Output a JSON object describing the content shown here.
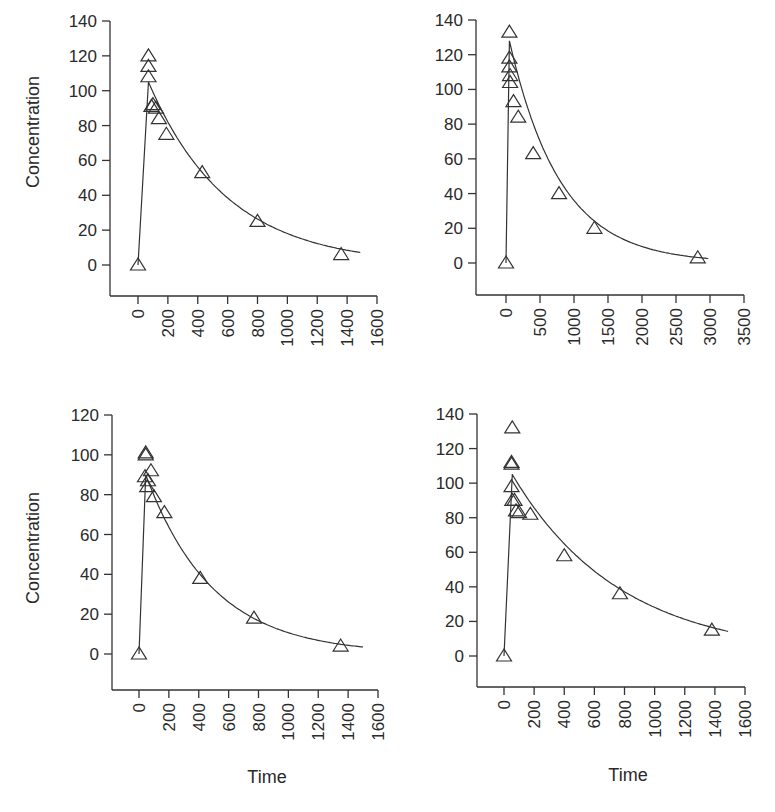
{
  "chart_data": [
    {
      "type": "scatter",
      "panel": "top-left",
      "title": "",
      "xlabel": "",
      "ylabel": "Concentration",
      "xlim": [
        0,
        1600
      ],
      "ylim": [
        0,
        140
      ],
      "xticks": [
        0,
        200,
        400,
        600,
        800,
        1000,
        1200,
        1400,
        1600
      ],
      "yticks": [
        0,
        20,
        40,
        60,
        80,
        100,
        120,
        140
      ],
      "grid": false,
      "legend": null,
      "marker": "open-triangle",
      "points": [
        {
          "x": 0,
          "y": 0
        },
        {
          "x": 70,
          "y": 120
        },
        {
          "x": 70,
          "y": 114
        },
        {
          "x": 70,
          "y": 108
        },
        {
          "x": 90,
          "y": 91
        },
        {
          "x": 100,
          "y": 92
        },
        {
          "x": 120,
          "y": 90
        },
        {
          "x": 140,
          "y": 84
        },
        {
          "x": 190,
          "y": 75
        },
        {
          "x": 430,
          "y": 53
        },
        {
          "x": 800,
          "y": 25
        },
        {
          "x": 1360,
          "y": 6
        }
      ],
      "fit_curve": {
        "peak_x": 70,
        "peak_y": 105,
        "end_x": 1500,
        "end_y": 7,
        "half_life_approx": 350
      }
    },
    {
      "type": "scatter",
      "panel": "top-right",
      "title": "",
      "xlabel": "",
      "ylabel": "",
      "xlim": [
        0,
        3500
      ],
      "ylim": [
        0,
        140
      ],
      "xticks": [
        0,
        500,
        1000,
        1500,
        2000,
        2500,
        3000,
        3500
      ],
      "yticks": [
        0,
        20,
        40,
        60,
        80,
        100,
        120,
        140
      ],
      "grid": false,
      "legend": null,
      "marker": "open-triangle",
      "points": [
        {
          "x": 0,
          "y": 0
        },
        {
          "x": 50,
          "y": 133
        },
        {
          "x": 50,
          "y": 118
        },
        {
          "x": 50,
          "y": 113
        },
        {
          "x": 60,
          "y": 108
        },
        {
          "x": 60,
          "y": 104
        },
        {
          "x": 110,
          "y": 93
        },
        {
          "x": 180,
          "y": 84
        },
        {
          "x": 400,
          "y": 63
        },
        {
          "x": 780,
          "y": 40
        },
        {
          "x": 1300,
          "y": 20
        },
        {
          "x": 2820,
          "y": 3
        }
      ],
      "fit_curve": {
        "peak_x": 50,
        "peak_y": 128,
        "end_x": 3000,
        "end_y": 2.5,
        "half_life_approx": 500
      }
    },
    {
      "type": "scatter",
      "panel": "bottom-left",
      "title": "",
      "xlabel": "Time",
      "ylabel": "Concentration",
      "xlim": [
        0,
        1600
      ],
      "ylim": [
        0,
        120
      ],
      "xticks": [
        0,
        200,
        400,
        600,
        800,
        1000,
        1200,
        1400,
        1600
      ],
      "yticks": [
        0,
        20,
        40,
        60,
        80,
        100,
        120
      ],
      "grid": false,
      "legend": null,
      "marker": "open-triangle",
      "points": [
        {
          "x": 0,
          "y": 0
        },
        {
          "x": 45,
          "y": 101
        },
        {
          "x": 45,
          "y": 100
        },
        {
          "x": 40,
          "y": 89
        },
        {
          "x": 80,
          "y": 92
        },
        {
          "x": 60,
          "y": 87
        },
        {
          "x": 55,
          "y": 84
        },
        {
          "x": 100,
          "y": 79
        },
        {
          "x": 170,
          "y": 71
        },
        {
          "x": 410,
          "y": 38
        },
        {
          "x": 770,
          "y": 18
        },
        {
          "x": 1350,
          "y": 4
        }
      ],
      "fit_curve": {
        "peak_x": 45,
        "peak_y": 90,
        "end_x": 1500,
        "end_y": 3.5,
        "half_life_approx": 290
      }
    },
    {
      "type": "scatter",
      "panel": "bottom-right",
      "title": "",
      "xlabel": "Time",
      "ylabel": "",
      "xlim": [
        0,
        1600
      ],
      "ylim": [
        0,
        140
      ],
      "xticks": [
        0,
        200,
        400,
        600,
        800,
        1000,
        1200,
        1400,
        1600
      ],
      "yticks": [
        0,
        20,
        40,
        60,
        80,
        100,
        120,
        140
      ],
      "grid": false,
      "legend": null,
      "marker": "open-triangle",
      "points": [
        {
          "x": 0,
          "y": 0
        },
        {
          "x": 55,
          "y": 132
        },
        {
          "x": 50,
          "y": 112
        },
        {
          "x": 50,
          "y": 111
        },
        {
          "x": 50,
          "y": 98
        },
        {
          "x": 55,
          "y": 90
        },
        {
          "x": 70,
          "y": 90
        },
        {
          "x": 80,
          "y": 84
        },
        {
          "x": 100,
          "y": 83
        },
        {
          "x": 175,
          "y": 82
        },
        {
          "x": 400,
          "y": 58
        },
        {
          "x": 770,
          "y": 36
        },
        {
          "x": 1380,
          "y": 15
        }
      ],
      "fit_curve": {
        "peak_x": 55,
        "peak_y": 105,
        "end_x": 1500,
        "end_y": 14,
        "half_life_approx": 480
      }
    }
  ],
  "labels": {
    "concentration": "Concentration",
    "time": "Time"
  }
}
